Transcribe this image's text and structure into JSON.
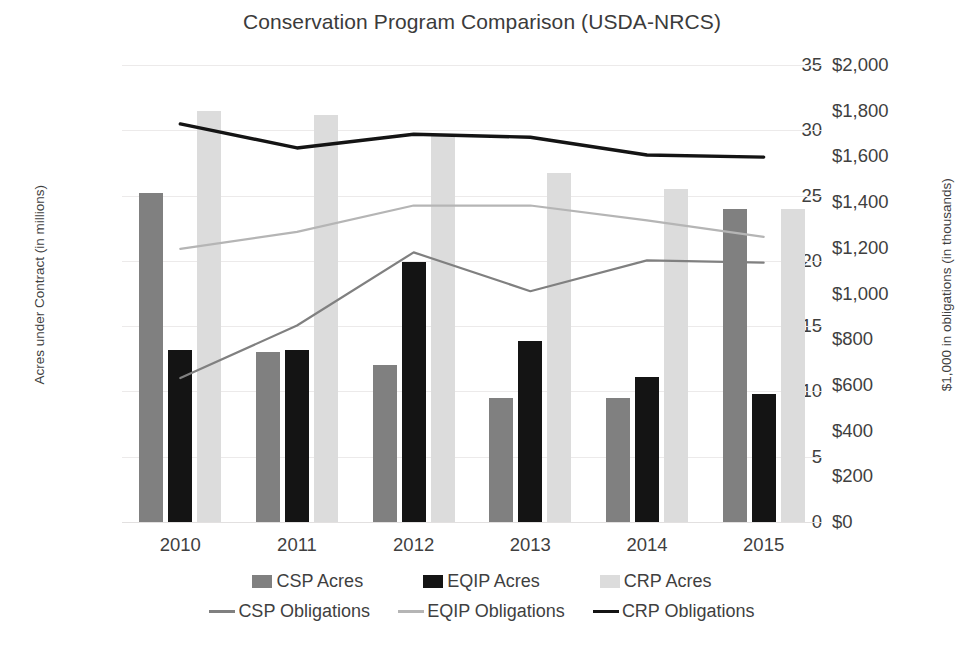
{
  "chart_data": {
    "type": "bar",
    "title": "Conservation Program Comparison (USDA-NRCS)",
    "xlabel": "",
    "ylabel": "Acres under Contract (in millions)",
    "y2label": "$1,000 in obligations (in thousands)",
    "categories": [
      "2010",
      "2011",
      "2012",
      "2013",
      "2014",
      "2015"
    ],
    "ylim": [
      0,
      35
    ],
    "y2lim": [
      0,
      2000
    ],
    "yticks": [
      "0",
      "5",
      "10",
      "15",
      "20",
      "25",
      "30",
      "35"
    ],
    "y2ticks": [
      "$0",
      "$200",
      "$400",
      "$600",
      "$800",
      "$1,000",
      "$1,200",
      "$1,400",
      "$1,600",
      "$1,800",
      "$2,000"
    ],
    "grid": true,
    "legend_position": "bottom",
    "colors": {
      "csp_bar": "#808080",
      "eqip_bar": "#141414",
      "crp_bar": "#dcdcdc",
      "csp_line": "#808080",
      "eqip_line": "#b5b5b5",
      "crp_line": "#141414"
    },
    "series": [
      {
        "name": "CSP Acres",
        "kind": "bar",
        "axis": "left",
        "values": [
          25.2,
          13.0,
          12.0,
          9.5,
          9.5,
          24.0
        ]
      },
      {
        "name": "EQIP Acres",
        "kind": "bar",
        "axis": "left",
        "values": [
          13.2,
          13.2,
          19.9,
          13.9,
          11.1,
          9.8
        ]
      },
      {
        "name": "CRP Acres",
        "kind": "bar",
        "axis": "left",
        "values": [
          31.5,
          31.2,
          29.6,
          26.7,
          25.5,
          24.0
        ]
      },
      {
        "name": "CSP Obligations",
        "kind": "line",
        "axis": "right",
        "values": [
          630,
          860,
          1180,
          1010,
          1145,
          1135
        ]
      },
      {
        "name": "EQIP Obligations",
        "kind": "line",
        "axis": "right",
        "values": [
          1195,
          1270,
          1385,
          1385,
          1320,
          1248
        ]
      },
      {
        "name": "CRP Obligations",
        "kind": "line",
        "axis": "right",
        "values": [
          1742,
          1637,
          1697,
          1684,
          1606,
          1597
        ]
      }
    ]
  },
  "legend": {
    "row1": [
      {
        "label": "CSP Acres",
        "swatch": "#808080"
      },
      {
        "label": "EQIP Acres",
        "swatch": "#141414"
      },
      {
        "label": "CRP Acres",
        "swatch": "#dcdcdc"
      }
    ],
    "row2": [
      {
        "label": "CSP Obligations",
        "swatch": "#808080"
      },
      {
        "label": "EQIP Obligations",
        "swatch": "#b5b5b5"
      },
      {
        "label": "CRP Obligations",
        "swatch": "#141414"
      }
    ]
  }
}
